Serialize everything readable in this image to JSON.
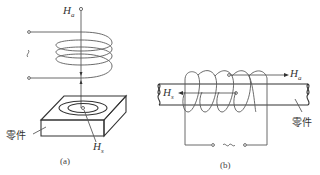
{
  "figure": {
    "panel_a": {
      "caption": "(a)",
      "field_label_top": "H",
      "field_label_top_sub": "a",
      "field_label_part": "H",
      "field_label_part_sub": "s",
      "part_label": "零件",
      "ac_symbol": "~"
    },
    "panel_b": {
      "caption": "(b)",
      "field_label_right": "H",
      "field_label_right_sub": "a",
      "field_label_left": "H",
      "field_label_left_sub": "s",
      "part_label": "零件",
      "ac_symbol": "~"
    },
    "colors": {
      "line": "#5a5a5a",
      "text": "#333333",
      "background": "#ffffff"
    }
  }
}
